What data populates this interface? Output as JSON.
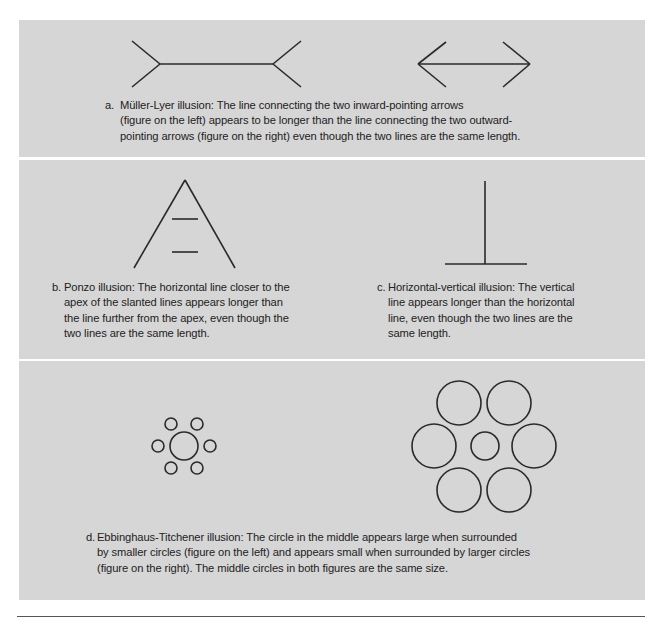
{
  "colors": {
    "panel_background": "#d6d6d6",
    "page_background": "#ffffff",
    "stroke": "#2a2a2a",
    "text": "#222222",
    "rule": "#555555"
  },
  "panels": [
    {
      "id": "a",
      "captions": [
        {
          "label": "a.",
          "title": "Müller-Lyer illusion",
          "lines": [
            "Müller-Lyer illusion: The line connecting the two inward-pointing arrows",
            "(figure on the left) appears to be longer than the line connecting the two outward-",
            "pointing arrows (figure on the right) even though the two lines are the same length."
          ]
        }
      ],
      "figures": [
        {
          "name": "muller-lyer-inward-fins",
          "shaft": [
            160,
            273
          ],
          "fin_direction": "outward-tails"
        },
        {
          "name": "muller-lyer-outward-arrows",
          "shaft": [
            418,
            530
          ],
          "fin_direction": "arrowheads"
        }
      ]
    },
    {
      "id": "bc",
      "captions": [
        {
          "label": "b.",
          "title": "Ponzo illusion",
          "lines": [
            "Ponzo illusion: The horizontal line closer to the",
            "apex of the slanted lines appears longer than",
            "the line further from the apex, even though the",
            "two lines are the same length."
          ]
        },
        {
          "label": "c.",
          "title": "Horizontal-vertical illusion",
          "lines": [
            "Horizontal-vertical illusion: The  vertical",
            "line appears longer than the horizontal",
            "line, even though the two lines are the",
            "same length."
          ]
        }
      ]
    },
    {
      "id": "d",
      "captions": [
        {
          "label": "d.",
          "title": "Ebbinghaus-Titchener illusion",
          "lines": [
            "Ebbinghaus-Titchener illusion: The circle in the middle appears large when surrounded",
            "by smaller circles (figure on the left) and appears small when surrounded by larger circles",
            "(figure on the right). The middle circles in both figures are the same size."
          ]
        }
      ],
      "figures": [
        {
          "name": "ebbinghaus-small-surround",
          "center_radius": 14,
          "surround_radius": 6,
          "surround_count": 6
        },
        {
          "name": "ebbinghaus-large-surround",
          "center_radius": 14,
          "surround_radius": 22,
          "surround_count": 6
        }
      ]
    }
  ]
}
